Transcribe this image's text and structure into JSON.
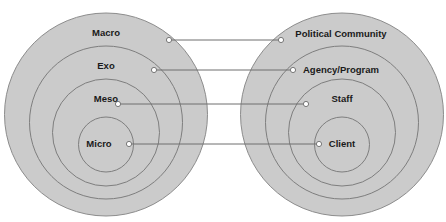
{
  "diagram": {
    "type": "paired-concentric-circles",
    "colors": {
      "background": "#ffffff",
      "circle_fill": "#cbcbcb",
      "circle_stroke": "#8c8c8c",
      "connector": "#6e6e6e",
      "dot_fill": "#ffffff",
      "text": "#1a1a1a"
    },
    "left": {
      "levels": [
        {
          "label": "Macro"
        },
        {
          "label": "Exo"
        },
        {
          "label": "Meso"
        },
        {
          "label": "Micro"
        }
      ]
    },
    "right": {
      "levels": [
        {
          "label": "Political Community"
        },
        {
          "label": "Agency/Program"
        },
        {
          "label": "Staff"
        },
        {
          "label": "Client"
        }
      ]
    },
    "connections": [
      {
        "from": "Macro",
        "to": "Political Community"
      },
      {
        "from": "Exo",
        "to": "Agency/Program"
      },
      {
        "from": "Meso",
        "to": "Staff"
      },
      {
        "from": "Micro",
        "to": "Client"
      }
    ]
  }
}
